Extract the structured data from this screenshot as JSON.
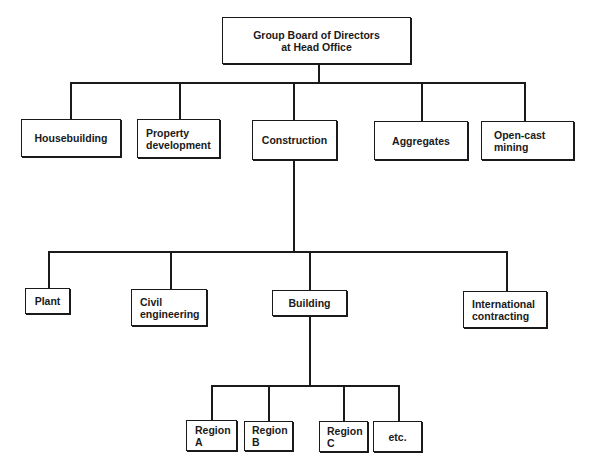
{
  "diagram": {
    "root": {
      "label": "Group Board of Directors\nat Head Office"
    },
    "divisions": [
      {
        "label": "Housebuilding"
      },
      {
        "label": "Property\ndevelopment"
      },
      {
        "label": "Construction"
      },
      {
        "label": "Aggregates"
      },
      {
        "label": "Open-cast\nmining"
      }
    ],
    "construction_units": [
      {
        "label": "Plant"
      },
      {
        "label": "Civil\nengineering"
      },
      {
        "label": "Building"
      },
      {
        "label": "International\ncontracting"
      }
    ],
    "building_regions": [
      {
        "label": "Region\nA"
      },
      {
        "label": "Region\nB"
      },
      {
        "label": "Region\nC"
      },
      {
        "label": "etc."
      }
    ]
  }
}
